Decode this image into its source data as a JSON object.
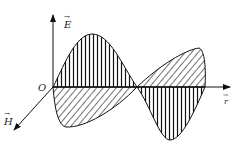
{
  "diagram": {
    "title": "",
    "type": "electromagnetic-wave",
    "labels": {
      "origin": "O",
      "e_axis": "E",
      "h_axis": "H",
      "r_axis": "r",
      "vector_mark": "→"
    },
    "colors": {
      "stroke": "#111111",
      "background": "#ffffff"
    }
  }
}
